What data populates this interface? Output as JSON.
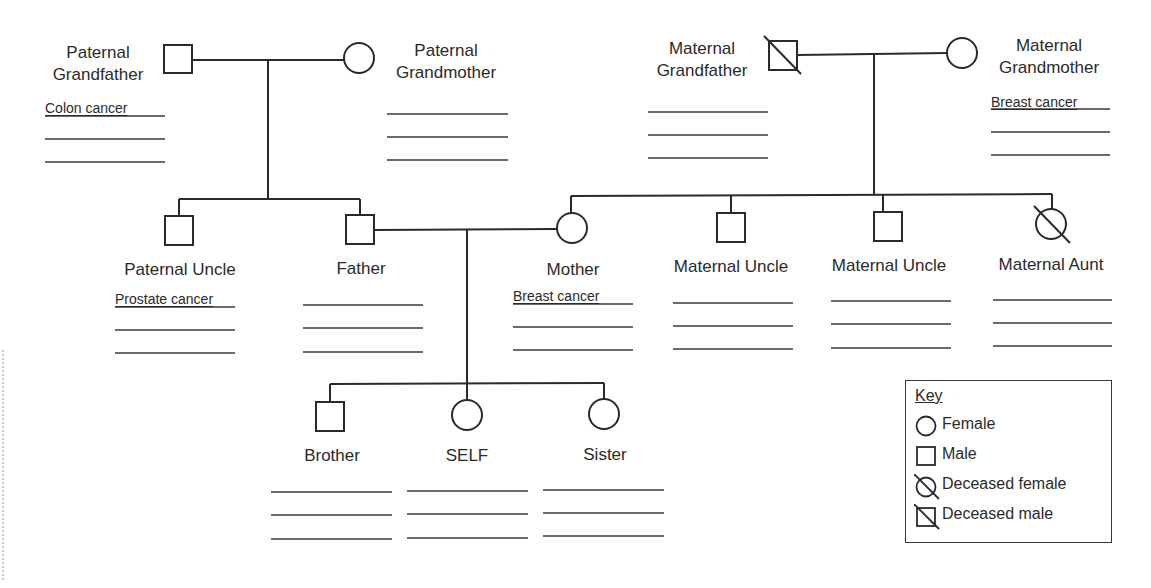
{
  "diagram": {
    "type": "pedigree-chart",
    "line_color": "#2a2a2a",
    "individuals": [
      {
        "id": "pgf",
        "label": "Paternal Grandfather",
        "label_lines": [
          "Paternal",
          "Grandfather"
        ],
        "sex": "male",
        "deceased": false,
        "condition": "Colon cancer",
        "blank_lines": 2
      },
      {
        "id": "pgm",
        "label": "Paternal Grandmother",
        "label_lines": [
          "Paternal",
          "Grandmother"
        ],
        "sex": "female",
        "deceased": false,
        "condition": "",
        "blank_lines": 3
      },
      {
        "id": "mgf",
        "label": "Maternal Grandfather",
        "label_lines": [
          "Maternal",
          "Grandfather"
        ],
        "sex": "male",
        "deceased": true,
        "condition": "",
        "blank_lines": 3
      },
      {
        "id": "mgm",
        "label": "Maternal Grandmother",
        "label_lines": [
          "Maternal",
          "Grandmother"
        ],
        "sex": "female",
        "deceased": false,
        "condition": "Breast cancer",
        "blank_lines": 2
      },
      {
        "id": "pu",
        "label": "Paternal Uncle",
        "sex": "male",
        "deceased": false,
        "condition": "Prostate cancer",
        "blank_lines": 2
      },
      {
        "id": "father",
        "label": "Father",
        "sex": "male",
        "deceased": false,
        "condition": "",
        "blank_lines": 3
      },
      {
        "id": "mother",
        "label": "Mother",
        "sex": "female",
        "deceased": false,
        "condition": "Breast cancer",
        "blank_lines": 2
      },
      {
        "id": "mu1",
        "label": "Maternal Uncle",
        "sex": "male",
        "deceased": false,
        "condition": "",
        "blank_lines": 3
      },
      {
        "id": "mu2",
        "label": "Maternal Uncle",
        "sex": "male",
        "deceased": false,
        "condition": "",
        "blank_lines": 3
      },
      {
        "id": "ma",
        "label": "Maternal Aunt",
        "sex": "female",
        "deceased": true,
        "condition": "",
        "blank_lines": 3
      },
      {
        "id": "brother",
        "label": "Brother",
        "sex": "male",
        "deceased": false,
        "condition": "",
        "blank_lines": 3
      },
      {
        "id": "self",
        "label": "SELF",
        "sex": "female",
        "deceased": false,
        "condition": "",
        "blank_lines": 3
      },
      {
        "id": "sister",
        "label": "Sister",
        "sex": "female",
        "deceased": false,
        "condition": "",
        "blank_lines": 3
      }
    ],
    "relationships": [
      {
        "couple": [
          "pgf",
          "pgm"
        ],
        "children": [
          "pu",
          "father"
        ]
      },
      {
        "couple": [
          "mgf",
          "mgm"
        ],
        "children": [
          "mother",
          "mu1",
          "mu2",
          "ma"
        ]
      },
      {
        "couple": [
          "father",
          "mother"
        ],
        "children": [
          "brother",
          "self",
          "sister"
        ]
      }
    ]
  },
  "labels": {
    "pgf_1": "Paternal",
    "pgf_2": "Grandfather",
    "pgf_cond": "Colon cancer",
    "pgm_1": "Paternal",
    "pgm_2": "Grandmother",
    "mgf_1": "Maternal",
    "mgf_2": "Grandfather",
    "mgm_1": "Maternal",
    "mgm_2": "Grandmother",
    "mgm_cond": "Breast cancer",
    "pu": "Paternal Uncle",
    "pu_cond": "Prostate cancer",
    "father": "Father",
    "mother": "Mother",
    "mother_cond": "Breast cancer",
    "mu1": "Maternal Uncle",
    "mu2": "Maternal Uncle",
    "ma": "Maternal Aunt",
    "brother": "Brother",
    "self": "SELF",
    "sister": "Sister"
  },
  "key": {
    "title": "Key",
    "items": [
      {
        "symbol": "circle-icon",
        "label": "Female"
      },
      {
        "symbol": "square-icon",
        "label": "Male"
      },
      {
        "symbol": "deceased-circle-icon",
        "label": "Deceased female"
      },
      {
        "symbol": "deceased-square-icon",
        "label": "Deceased male"
      }
    ]
  }
}
